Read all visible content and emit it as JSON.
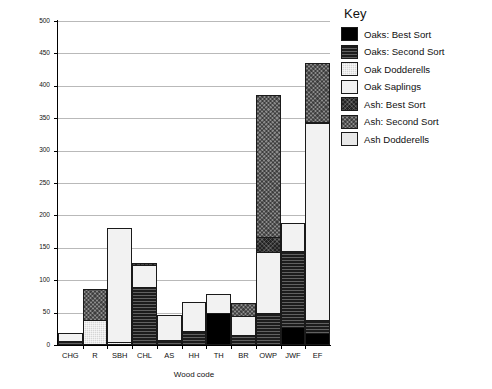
{
  "chart_data": {
    "type": "bar",
    "title": "",
    "xlabel": "Wood code",
    "ylabel": "Number of Trees",
    "ylim": [
      0,
      500
    ],
    "yticks": [
      0,
      50,
      100,
      150,
      200,
      250,
      300,
      350,
      400,
      450,
      500
    ],
    "grid": true,
    "stacked": true,
    "legend_title": "Key",
    "legend_position": "right",
    "categories": [
      "CHG",
      "R",
      "SBH",
      "CHL",
      "AS",
      "HH",
      "TH",
      "BR",
      "OWP",
      "JWF",
      "EF"
    ],
    "series": [
      {
        "name": "Oaks: Best Sort",
        "key": "oak-best",
        "color": "#000000",
        "values": [
          0,
          0,
          0,
          0,
          0,
          0,
          47,
          0,
          0,
          25,
          16
        ]
      },
      {
        "name": "Oaks: Second Sort",
        "key": "oak-second",
        "color": "#1c1c1c",
        "values": [
          3,
          0,
          0,
          86,
          5,
          19,
          0,
          12,
          47,
          117,
          20
        ]
      },
      {
        "name": "Oak Dodderells",
        "key": "oak-dodd",
        "color": "#d6d6d6",
        "values": [
          0,
          36,
          2,
          0,
          0,
          0,
          0,
          0,
          0,
          0,
          0
        ]
      },
      {
        "name": "Oak Saplings",
        "key": "oak-sap",
        "color": "#f2f2f2",
        "values": [
          12,
          0,
          176,
          34,
          38,
          45,
          28,
          29,
          94,
          44,
          303
        ]
      },
      {
        "name": "Ash: Best Sort",
        "key": "ash-best",
        "color": "#232323",
        "values": [
          0,
          0,
          0,
          3,
          0,
          0,
          0,
          0,
          22,
          0,
          1
        ]
      },
      {
        "name": "Ash: Second Sort",
        "key": "ash-second",
        "color": "#8b8b8b",
        "values": [
          0,
          47,
          0,
          0,
          0,
          0,
          0,
          21,
          220,
          0,
          91
        ]
      },
      {
        "name": "Ash Dodderells",
        "key": "ash-dodd",
        "color": "#e8e8e8",
        "values": [
          0,
          0,
          0,
          0,
          0,
          0,
          0,
          0,
          0,
          0,
          0
        ]
      }
    ],
    "totals": [
      15,
      83,
      178,
      123,
      43,
      64,
      75,
      62,
      383,
      186,
      431
    ]
  },
  "legend": {
    "title": "Key",
    "items": [
      {
        "label": "Oaks: Best Sort",
        "swatch": "oak-best"
      },
      {
        "label": "Oaks: Second Sort",
        "swatch": "oak-second"
      },
      {
        "label": "Oak Dodderells",
        "swatch": "oak-dodd"
      },
      {
        "label": "Oak Saplings",
        "swatch": "oak-sap"
      },
      {
        "label": "Ash: Best Sort",
        "swatch": "ash-best"
      },
      {
        "label": "Ash: Second Sort",
        "swatch": "ash-second"
      },
      {
        "label": "Ash Dodderells",
        "swatch": "ash-dodd"
      }
    ]
  }
}
